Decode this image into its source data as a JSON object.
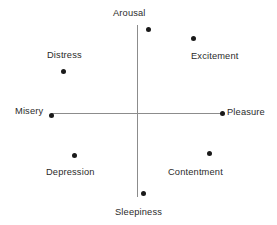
{
  "chart_data": {
    "type": "scatter",
    "title": "",
    "xlabel": "",
    "ylabel": "",
    "xlim": [
      -1,
      1
    ],
    "ylim": [
      -1,
      1
    ],
    "grid": false,
    "legend": "none",
    "axis_labels": {
      "top": "Arousal",
      "right": "Pleasure",
      "bottom": "Sleepiness",
      "left": "Misery"
    },
    "points": [
      {
        "label": "Arousal",
        "x": 0.07,
        "y": 0.98,
        "px": 148,
        "py": 29,
        "label_px": 113,
        "label_py": 8,
        "label_align": "left"
      },
      {
        "label": "Excitement",
        "x": 0.66,
        "y": 0.86,
        "px": 193,
        "py": 38,
        "label_px": 191,
        "label_py": 51,
        "label_align": "left"
      },
      {
        "label": "Pleasure",
        "x": 1.0,
        "y": 0.0,
        "px": 222,
        "py": 113,
        "label_px": 227,
        "label_py": 107,
        "label_align": "left"
      },
      {
        "label": "Contentment",
        "x": 0.84,
        "y": -0.47,
        "px": 209,
        "py": 153,
        "label_px": 168,
        "label_py": 167,
        "label_align": "left"
      },
      {
        "label": "Sleepiness",
        "x": 0.07,
        "y": -0.93,
        "px": 143,
        "py": 193,
        "label_px": 115,
        "label_py": 207,
        "label_align": "left"
      },
      {
        "label": "Depression",
        "x": -0.74,
        "y": -0.49,
        "px": 74,
        "py": 155,
        "label_px": 46,
        "label_py": 167,
        "label_align": "left"
      },
      {
        "label": "Misery",
        "x": -1.0,
        "y": -0.02,
        "px": 51,
        "py": 115,
        "label_px": 15,
        "label_py": 106,
        "label_align": "left"
      },
      {
        "label": "Distress",
        "x": -0.87,
        "y": 0.5,
        "px": 63,
        "py": 71,
        "label_px": 47,
        "label_py": 50,
        "label_align": "left"
      }
    ],
    "axes": {
      "vertical": {
        "x": 137,
        "y_top": 25,
        "y_bottom": 197
      },
      "horizontal": {
        "y": 113,
        "x_left": 52,
        "x_right": 222
      }
    },
    "colors": {
      "point": "#1a1a1a",
      "axis": "#8c8c8c",
      "text": "#2b2b2b",
      "background": "#ffffff"
    }
  }
}
